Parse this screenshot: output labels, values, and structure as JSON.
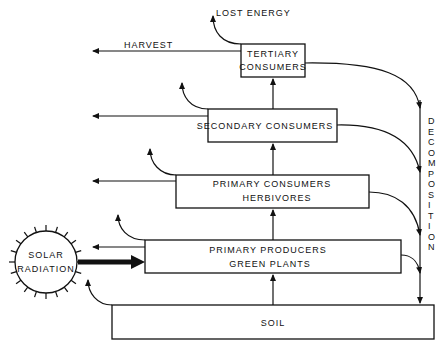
{
  "diagram": {
    "nodes": {
      "tertiary": {
        "line1": "TERTIARY",
        "line2": "CONSUMERS"
      },
      "secondary": {
        "line1": "SECONDARY CONSUMERS"
      },
      "primary_consumers": {
        "line1": "PRIMARY CONSUMERS",
        "line2": "HERBIVORES"
      },
      "primary_producers": {
        "line1": "PRIMARY PRODUCERS",
        "line2": "GREEN PLANTS"
      },
      "soil": {
        "line1": "SOIL"
      },
      "sun": {
        "line1": "SOLAR",
        "line2": "RADIATION"
      }
    },
    "labels": {
      "lost_energy": "LOST ENERGY",
      "harvest": "HARVEST",
      "decomposition": [
        "D",
        "E",
        "C",
        "O",
        "M",
        "P",
        "O",
        "S",
        "I",
        "T",
        "I",
        "O",
        "N"
      ]
    },
    "colors": {
      "ink": "#111111",
      "background": "#ffffff"
    }
  }
}
